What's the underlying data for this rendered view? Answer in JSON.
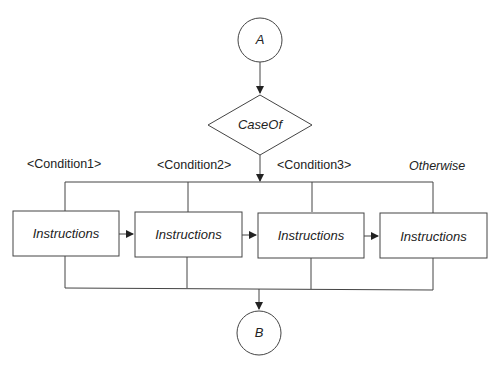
{
  "diagram": {
    "type": "flowchart",
    "title": "",
    "start_node": {
      "label": "A"
    },
    "decision": {
      "label": "CaseOf"
    },
    "conditions": [
      {
        "label": "<Condition1>"
      },
      {
        "label": "<Condition2>"
      },
      {
        "label": "<Condition3>"
      },
      {
        "label": "Otherwise"
      }
    ],
    "instructions": [
      {
        "label": "Instructions"
      },
      {
        "label": "Instructions"
      },
      {
        "label": "Instructions"
      },
      {
        "label": "Instructions"
      }
    ],
    "end_node": {
      "label": "B"
    },
    "colors": {
      "stroke": "#333333",
      "background": "#ffffff",
      "text": "#222222"
    }
  }
}
